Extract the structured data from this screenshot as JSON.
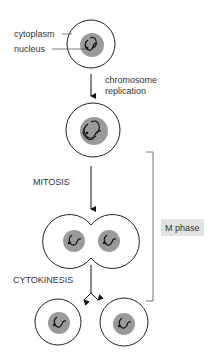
{
  "labels": {
    "cytoplasm": "cytoplasm",
    "nucleus": "nucleus",
    "replication_line1": "chromosome",
    "replication_line2": "replication",
    "mitosis": "MITOSIS",
    "cytokinesis": "CYTOKINESIS",
    "m_phase": "M phase"
  },
  "colors": {
    "outline": "#222222",
    "nucleus_fill": "#9a9a9a",
    "chromosome": "#111111",
    "bracket": "#777777",
    "m_phase_bg": "#e2e2e2",
    "text": "#333333"
  },
  "stages": [
    {
      "name": "interphase cell"
    },
    {
      "name": "cell after chromosome replication"
    },
    {
      "name": "dividing cell (mitosis)"
    },
    {
      "name": "daughter cells (cytokinesis)"
    }
  ]
}
